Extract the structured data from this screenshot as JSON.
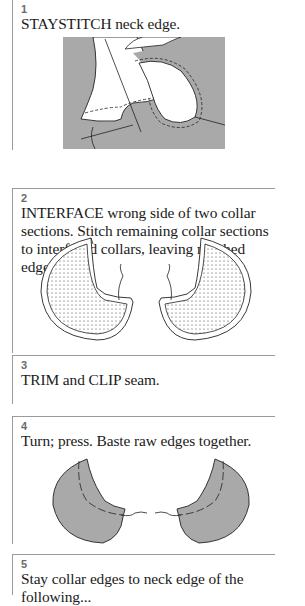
{
  "steps": [
    {
      "number": "1",
      "text": "STAYSTITCH neck edge.",
      "illustration": "staystitch-neck-edge"
    },
    {
      "number": "2",
      "text": "INTERFACE wrong side of two collar sections. Stitch remaining collar sections to interfaced collars, leaving notched edges open.",
      "illustration": "interfaced-collar-sections"
    },
    {
      "number": "3",
      "text": "TRIM and CLIP seam."
    },
    {
      "number": "4",
      "text": "Turn; press. Baste raw edges together.",
      "illustration": "turned-collars"
    },
    {
      "number": "5",
      "text": "Stay collar edges to neck edge of the following..."
    }
  ],
  "colors": {
    "fabric_gray": "#a9a9a9",
    "rule_gray": "#9a9a9a",
    "step_number_gray": "#6a6a6a",
    "text": "#1a1a1a"
  }
}
